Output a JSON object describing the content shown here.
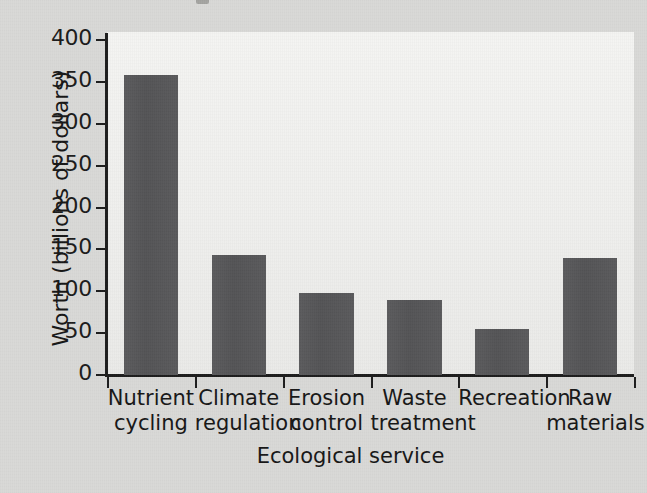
{
  "figure": {
    "background_color": "#d9d9d7",
    "plot_background_color": "#f3f3f1",
    "bar_color": "#565658",
    "axis_color": "#1d1d1d"
  },
  "chart_data": {
    "type": "bar",
    "title": "",
    "xlabel": "Ecological service",
    "ylabel": "Worth (billions of dollars)",
    "categories": [
      "Nutrient cycling",
      "Climate regulation",
      "Erosion control",
      "Waste treatment",
      "Recreation",
      "Raw materials"
    ],
    "category_lines": [
      [
        "Nutrient",
        "cycling"
      ],
      [
        "Climate",
        "regulation"
      ],
      [
        "Erosion",
        "control"
      ],
      [
        "Waste",
        "treatment"
      ],
      [
        "Recreation",
        ""
      ],
      [
        "Raw",
        "materials"
      ]
    ],
    "values": [
      358,
      143,
      98,
      90,
      55,
      140
    ],
    "ylim": [
      0,
      400
    ],
    "yticks": [
      0,
      50,
      100,
      150,
      200,
      250,
      300,
      350,
      400
    ],
    "ytick_labels": [
      "0",
      "50",
      "100",
      "150",
      "200",
      "250",
      "300",
      "350",
      "400"
    ],
    "grid": false,
    "legend": false,
    "units": "billions of dollars"
  }
}
